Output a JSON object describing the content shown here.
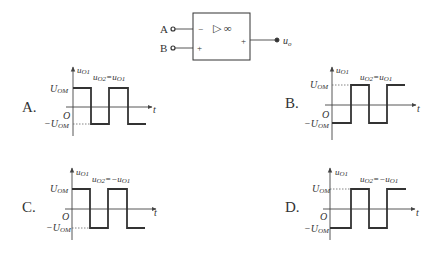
{
  "circuit": {
    "input_a_label": "A",
    "input_b_label": "B",
    "inverting_sign": "−",
    "noninverting_sign": "+",
    "output_sign": "+",
    "opamp_symbol": "▷ ∞",
    "output_label": "u",
    "output_sub": "o"
  },
  "options": [
    {
      "letter": "A.",
      "y_label": "u",
      "y_sub": "O1",
      "relation": "u",
      "relation_sub1": "O2",
      "relation_mid": "=u",
      "relation_sub2": "O1",
      "pos_label": "U",
      "pos_sub": "OM",
      "neg_label": "−U",
      "neg_sub": "OM",
      "origin": "O",
      "t_label": "t",
      "start_high": true
    },
    {
      "letter": "B.",
      "y_label": "u",
      "y_sub": "O1",
      "relation": "u",
      "relation_sub1": "O2",
      "relation_mid": "=u",
      "relation_sub2": "O1",
      "pos_label": "U",
      "pos_sub": "OM",
      "neg_label": "−U",
      "neg_sub": "OM",
      "origin": "O",
      "t_label": "t",
      "start_high": false
    },
    {
      "letter": "C.",
      "y_label": "u",
      "y_sub": "O1",
      "relation": "u",
      "relation_sub1": "O2",
      "relation_mid": "=−u",
      "relation_sub2": "O1",
      "pos_label": "U",
      "pos_sub": "OM",
      "neg_label": "−U",
      "neg_sub": "OM",
      "origin": "O",
      "t_label": "t",
      "start_high": true
    },
    {
      "letter": "D.",
      "y_label": "u",
      "y_sub": "O1",
      "relation": "u",
      "relation_sub1": "O2",
      "relation_mid": "=−u",
      "relation_sub2": "O1",
      "pos_label": "U",
      "pos_sub": "OM",
      "neg_label": "−U",
      "neg_sub": "OM",
      "origin": "O",
      "t_label": "t",
      "start_high": false
    }
  ]
}
